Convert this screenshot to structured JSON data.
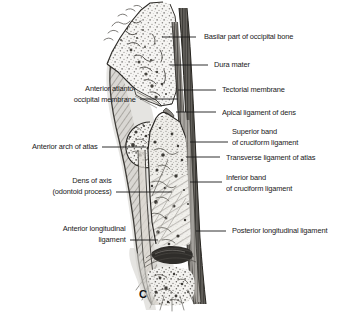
{
  "figure": {
    "panel_label": "C",
    "type": "anatomical-illustration",
    "style": "grayscale pen-and-ink medical illustration",
    "background_color": "#ffffff",
    "ink_color": "#1a1a1a"
  },
  "labels_left": [
    {
      "id": "anterior-atlanto-occipital-membrane",
      "lines": [
        "Anterior atlanto-",
        "occipital membrane"
      ],
      "text_right_x": 136,
      "text_top_y": 84,
      "leader": [
        [
          140,
          99
        ],
        [
          178,
          99
        ]
      ]
    },
    {
      "id": "anterior-arch-of-atlas",
      "lines": [
        "Anterior arch of atlas"
      ],
      "text_right_x": 98,
      "text_top_y": 142,
      "leader": [
        [
          102,
          147
        ],
        [
          146,
          147
        ]
      ]
    },
    {
      "id": "dens-of-axis",
      "lines": [
        "Dens of axis",
        "(odontoid process)"
      ],
      "text_right_x": 112,
      "text_top_y": 176,
      "leader": [
        [
          116,
          192
        ],
        [
          172,
          192
        ]
      ]
    },
    {
      "id": "anterior-longitudinal-ligament",
      "lines": [
        "Anterior longitudinal",
        "ligament"
      ],
      "text_right_x": 126,
      "text_top_y": 224,
      "leader": [
        [
          130,
          240
        ],
        [
          158,
          240
        ]
      ]
    }
  ],
  "labels_right": [
    {
      "id": "basilar-part-of-occipital-bone",
      "lines": [
        "Basilar part of occipital bone"
      ],
      "text_left_x": 204,
      "text_top_y": 32,
      "leader": [
        [
          196,
          37
        ],
        [
          162,
          37
        ]
      ]
    },
    {
      "id": "dura-mater",
      "lines": [
        "Dura mater"
      ],
      "text_left_x": 214,
      "text_top_y": 60,
      "leader": [
        [
          208,
          65
        ],
        [
          170,
          65
        ]
      ]
    },
    {
      "id": "tectorial-membrane",
      "lines": [
        "Tectorial membrane"
      ],
      "text_left_x": 222,
      "text_top_y": 85,
      "leader": [
        [
          216,
          90
        ],
        [
          178,
          90
        ]
      ]
    },
    {
      "id": "apical-ligament-of-dens",
      "lines": [
        "Apical ligament of dens"
      ],
      "text_left_x": 222,
      "text_top_y": 108,
      "leader": [
        [
          216,
          112
        ],
        [
          176,
          112
        ]
      ]
    },
    {
      "id": "superior-band-of-cruciform-ligament",
      "lines": [
        "Superior band",
        "of cruciform ligament"
      ],
      "text_left_x": 232,
      "text_top_y": 127,
      "leader": [
        [
          228,
          142
        ],
        [
          190,
          142
        ]
      ]
    },
    {
      "id": "transverse-ligament-of-atlas",
      "lines": [
        "Transverse ligament of atlas"
      ],
      "text_left_x": 226,
      "text_top_y": 153,
      "leader": [
        [
          220,
          157
        ],
        [
          186,
          157
        ]
      ]
    },
    {
      "id": "inferior-band-of-cruciform-ligament",
      "lines": [
        "Inferior band",
        "of cruciform ligament"
      ],
      "text_left_x": 226,
      "text_top_y": 173,
      "leader": [
        [
          222,
          182
        ],
        [
          190,
          182
        ]
      ]
    },
    {
      "id": "posterior-longitudinal-ligament",
      "lines": [
        "Posterior longitudinal ligament"
      ],
      "text_left_x": 232,
      "text_top_y": 226,
      "leader": [
        [
          226,
          231
        ],
        [
          196,
          231
        ]
      ]
    }
  ]
}
